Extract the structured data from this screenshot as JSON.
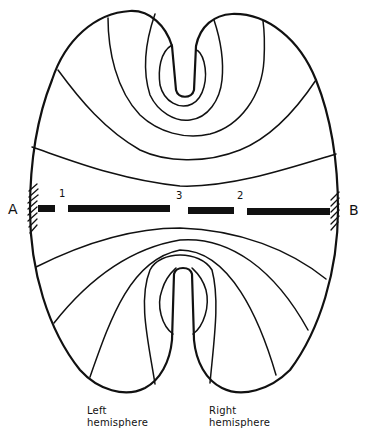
{
  "diagram": {
    "type": "field-line diagram of brain cross-section with electrode line",
    "endpoints": {
      "left": "A",
      "right": "B"
    },
    "electrode_markers": [
      "1",
      "3",
      "2"
    ],
    "captions": {
      "left_line1": "Left",
      "left_line2": "hemisphere",
      "right_line1": "Right",
      "right_line2": "hemisphere"
    },
    "colors": {
      "line": "#111111",
      "background": "#ffffff"
    }
  }
}
